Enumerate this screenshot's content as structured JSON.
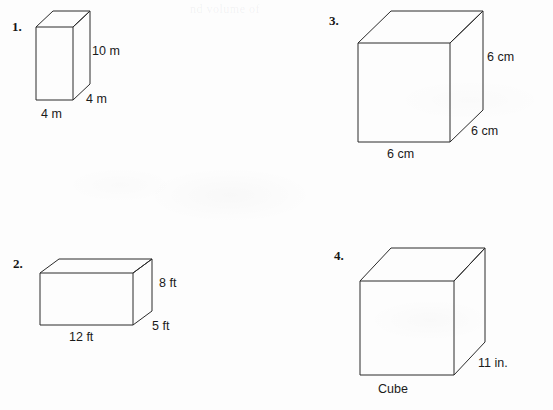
{
  "page": {
    "background_color": "#fdfdfd",
    "ink_color": "#2b2b2b",
    "faint_bleed_text": "nd volume of"
  },
  "figures": [
    {
      "number_label": "1.",
      "shape": "rectangular-prism",
      "labels": {
        "height": "10 m",
        "depth": "4 m",
        "width": "4 m"
      },
      "caption": ""
    },
    {
      "number_label": "2.",
      "shape": "rectangular-prism",
      "labels": {
        "height": "8 ft",
        "depth": "5 ft",
        "width": "12 ft"
      },
      "caption": ""
    },
    {
      "number_label": "3.",
      "shape": "rectangular-prism",
      "labels": {
        "height": "6 cm",
        "depth": "6 cm",
        "width": "6 cm"
      },
      "caption": ""
    },
    {
      "number_label": "4.",
      "shape": "cube",
      "labels": {
        "height": "",
        "depth": "11 in.",
        "width": ""
      },
      "caption": "Cube"
    }
  ]
}
